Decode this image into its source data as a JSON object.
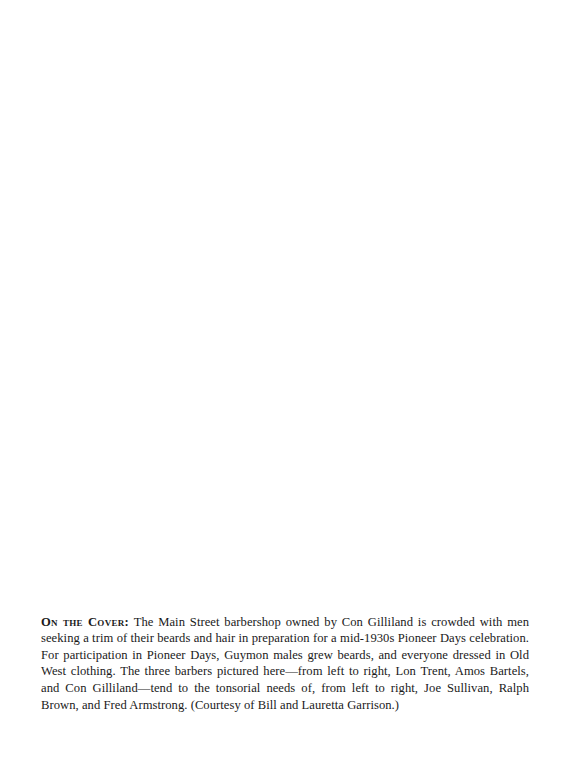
{
  "page": {
    "caption": {
      "lead": "On the Cover:",
      "body": "The Main Street barbershop owned by Con Gilliland is crowded with men seeking a trim of their beards and hair in preparation for a mid-1930s Pioneer Days celebration. For participation in Pioneer Days, Guymon males grew beards, and everyone dressed in Old West clothing. The three barbers pictured here—from left to right, Lon Trent, Amos Bartels, and Con Gilliland—tend to the tonsorial needs of, from left to right, Joe Sullivan, Ralph Brown, and Fred Armstrong. (Courtesy of Bill and Lauretta Garrison.)"
    }
  }
}
